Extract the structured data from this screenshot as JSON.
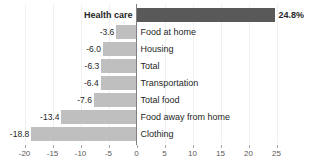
{
  "chart_data": {
    "type": "bar",
    "orientation": "horizontal",
    "title": "",
    "subtitle": "",
    "xlabel": "",
    "ylabel": "",
    "xlim": [
      -20,
      25
    ],
    "grid": true,
    "legend": false,
    "categories": [
      "Health care",
      "Food at home",
      "Housing",
      "Total",
      "Transportation",
      "Total food",
      "Food away from home",
      "Clothing"
    ],
    "values": [
      24.8,
      -3.6,
      -6.0,
      -6.3,
      -6.4,
      -7.6,
      -13.4,
      -18.8
    ],
    "data_labels": [
      "24.8%",
      "-3.6",
      "-6.0",
      "-6.3",
      "-6.4",
      "-7.6",
      "-13.4",
      "-18.8"
    ],
    "xticks": [
      -20,
      -15,
      -10,
      -5,
      0,
      5,
      10,
      15,
      20,
      25
    ],
    "xtick_labels": [
      "-20",
      "-15",
      "-10",
      "-5",
      "0",
      "5",
      "10",
      "15",
      "20",
      "25"
    ],
    "colors": {
      "positive_bar": "#595959",
      "negative_bar": "#bfbfbf",
      "axis_line": "#808080",
      "gridline": "#f0f0f0",
      "text": "#262626",
      "tick_text": "#595959",
      "background": "#ffffff"
    }
  },
  "bars": [
    {
      "category": "Health care",
      "value": 24.8,
      "data_label": "24.8%",
      "label_emphasis": "bold",
      "direction": "positive"
    },
    {
      "category": "Food at home",
      "value": -3.6,
      "data_label": "-3.6",
      "label_emphasis": "normal",
      "direction": "negative"
    },
    {
      "category": "Housing",
      "value": -6.0,
      "data_label": "-6.0",
      "label_emphasis": "normal",
      "direction": "negative"
    },
    {
      "category": "Total",
      "value": -6.3,
      "data_label": "-6.3",
      "label_emphasis": "normal",
      "direction": "negative"
    },
    {
      "category": "Transportation",
      "value": -6.4,
      "data_label": "-6.4",
      "label_emphasis": "normal",
      "direction": "negative"
    },
    {
      "category": "Total food",
      "value": -7.6,
      "data_label": "-7.6",
      "label_emphasis": "normal",
      "direction": "negative"
    },
    {
      "category": "Food away from home",
      "value": -13.4,
      "data_label": "-13.4",
      "label_emphasis": "normal",
      "direction": "negative"
    },
    {
      "category": "Clothing",
      "value": -18.8,
      "data_label": "-18.8",
      "label_emphasis": "normal",
      "direction": "negative"
    }
  ],
  "axis": {
    "ticks": [
      "-20",
      "-15",
      "-10",
      "-5",
      "0",
      "5",
      "10",
      "15",
      "20",
      "25"
    ]
  }
}
